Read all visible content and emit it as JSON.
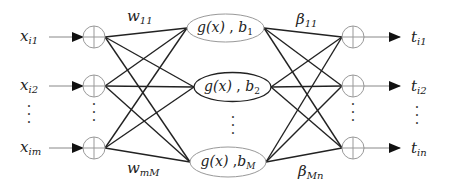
{
  "diagram": {
    "type": "neural-network (single hidden layer feedforward / ELM)",
    "inputs": [
      {
        "var": "x",
        "sub": "i1"
      },
      {
        "var": "x",
        "sub": "i2"
      },
      {
        "var": "x",
        "sub": "im"
      }
    ],
    "hidden_nodes": [
      {
        "func": "g(x)",
        "sep": " , ",
        "bias_var": "b",
        "bias_sub": "1"
      },
      {
        "func": "g(x)",
        "sep": " , ",
        "bias_var": "b",
        "bias_sub": "2"
      },
      {
        "func": "g(x)",
        "sep": " ,",
        "bias_var": "b",
        "bias_sub": "M"
      }
    ],
    "outputs": [
      {
        "var": "t",
        "sub": "i1"
      },
      {
        "var": "t",
        "sub": "i2"
      },
      {
        "var": "t",
        "sub": "in"
      }
    ],
    "weights": {
      "input_top": {
        "var": "w",
        "sub": "11"
      },
      "input_bottom": {
        "var": "w",
        "sub": "mM"
      },
      "output_top": {
        "var": "β",
        "sub": "11"
      },
      "output_bottom": {
        "var": "β",
        "sub": "Mn"
      }
    },
    "ellipsis": "⋮",
    "colors": {
      "line": "#222222",
      "node_outline": "#999999",
      "highlight_outline": "#222222",
      "arrow_line": "#999999"
    }
  }
}
